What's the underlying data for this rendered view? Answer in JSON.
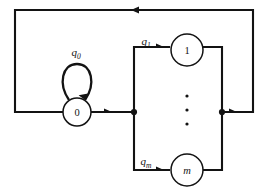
{
  "figure": {
    "kind": "state-transition-diagram",
    "width": 268,
    "height": 188,
    "background_color": "#ffffff",
    "stroke_color": "#131313"
  },
  "states": [
    {
      "id": "state-zero",
      "label": "0",
      "italic": false,
      "cx": 77,
      "cy": 112,
      "r": 14
    },
    {
      "id": "state-one",
      "label": "1",
      "italic": false,
      "cx": 187,
      "cy": 50,
      "r": 16
    },
    {
      "id": "state-m",
      "label": "m",
      "italic": true,
      "cx": 187,
      "cy": 170,
      "r": 16
    }
  ],
  "edge_labels": [
    {
      "id": "label-q0",
      "base": "q",
      "subscript": "0",
      "x": 76,
      "y": 56
    },
    {
      "id": "label-q1",
      "base": "q",
      "subscript": "1",
      "x": 146,
      "y": 45
    },
    {
      "id": "label-qm",
      "base": "q",
      "subscript": "m",
      "y": 165,
      "x": 146
    }
  ],
  "ellipsis": {
    "id": "vertical-ellipsis",
    "dot_count": 3,
    "cx": 187,
    "cy_values": [
      96,
      110,
      124
    ],
    "r": 1.6
  },
  "junctions": [
    {
      "id": "junction-left",
      "cx": 134,
      "cy": 112,
      "r": 3.1
    },
    {
      "id": "junction-right",
      "cx": 222,
      "cy": 112,
      "r": 3.1
    }
  ],
  "edges": [
    {
      "id": "self-loop-q0",
      "from": "state-zero",
      "to": "state-zero",
      "description": "self loop above state 0"
    },
    {
      "id": "edge-zero-to-junction",
      "from": "state-zero",
      "to": "junction-left",
      "description": "horizontal arrow right out of state 0"
    },
    {
      "id": "edge-junction-to-one",
      "from": "junction-left",
      "to": "state-one",
      "description": "up and right into state 1"
    },
    {
      "id": "edge-junction-to-m",
      "from": "junction-left",
      "to": "state-m",
      "description": "down and right into state m"
    },
    {
      "id": "edge-one-to-junction-right",
      "from": "state-one",
      "to": "junction-right",
      "description": "right and down out of state 1"
    },
    {
      "id": "edge-m-to-junction-right",
      "from": "state-m",
      "to": "junction-right",
      "description": "right and up out of state m"
    },
    {
      "id": "edge-feedback-return",
      "from": "junction-right",
      "to": "state-zero",
      "description": "outer return path right, up, across the top leftwards, down and back into state 0"
    }
  ]
}
